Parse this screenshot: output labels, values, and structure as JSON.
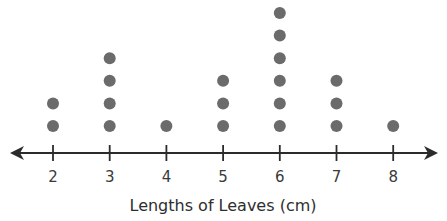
{
  "chart_data": {
    "type": "dot_plot",
    "title": "",
    "xlabel": "Lengths of Leaves (cm)",
    "ylabel": "",
    "categories": [
      "2",
      "3",
      "4",
      "5",
      "6",
      "7",
      "8"
    ],
    "x": [
      2,
      3,
      4,
      5,
      6,
      7,
      8
    ],
    "values": [
      2,
      4,
      1,
      3,
      6,
      3,
      1
    ],
    "xlim": [
      1.3,
      8.7
    ],
    "grid": false,
    "legend": null,
    "axis_arrows": "both ends",
    "colors": {
      "dot": "#6b6b6b",
      "axis": "#2b2b2b",
      "text": "#3a3a3a"
    }
  }
}
